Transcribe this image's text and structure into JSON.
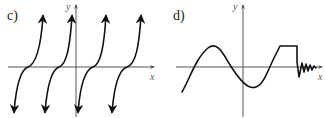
{
  "panels": [
    {
      "id": "c",
      "label": "c)",
      "x_axis_label": "x",
      "y_axis_label": "y",
      "description": "Periodic tangent-like curve with four branches, each rising from a downward arrow to an upward arrow, flattening as it crosses the x-axis"
    },
    {
      "id": "d",
      "label": "d)",
      "x_axis_label": "x",
      "y_axis_label": "y",
      "description": "Sinusoidal curve rising to a peak, dipping below the axis, rising to a flat plateau, then dropping into rapid oscillations near the x-axis"
    }
  ],
  "colors": {
    "curve": "#111111",
    "axis": "#555555"
  }
}
